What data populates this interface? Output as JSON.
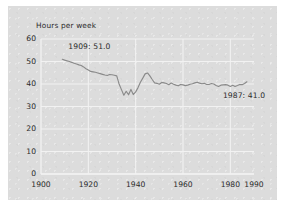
{
  "chart_data": {
    "type": "line",
    "title": "",
    "subtitle": "",
    "xlabel": "",
    "ylabel": "Hours per week",
    "xlim": [
      1900,
      1990
    ],
    "ylim": [
      0,
      60
    ],
    "grid": true,
    "legend": "none",
    "x_ticks": [
      "1900",
      "1920",
      "1940",
      "1960",
      "1980",
      "1990"
    ],
    "x_tick_values": [
      1900,
      1920,
      1940,
      1960,
      1980,
      1990
    ],
    "y_ticks": [
      "0",
      "10",
      "20",
      "30",
      "40",
      "50",
      "60"
    ],
    "y_tick_values": [
      0,
      10,
      20,
      30,
      40,
      50,
      60
    ],
    "line_color": "#8a8a8a",
    "grid_color": "#f2f2f2",
    "panel_color": "#dcdcdc",
    "text_color": "#2b2b2b",
    "annotations": [
      {
        "id": "start",
        "label": "1909: 51.0",
        "x": 1909,
        "y": 51.0
      },
      {
        "id": "end",
        "label": "1987: 41.0",
        "x": 1987,
        "y": 41.0
      }
    ],
    "series": [
      {
        "name": "Average hours worked per week",
        "x": [
          1909,
          1910,
          1911,
          1912,
          1913,
          1914,
          1915,
          1916,
          1917,
          1918,
          1919,
          1920,
          1921,
          1922,
          1923,
          1924,
          1925,
          1926,
          1927,
          1928,
          1929,
          1930,
          1931,
          1932,
          1933,
          1934,
          1935,
          1936,
          1937,
          1938,
          1939,
          1940,
          1941,
          1942,
          1943,
          1944,
          1945,
          1946,
          1947,
          1948,
          1949,
          1950,
          1951,
          1952,
          1953,
          1954,
          1955,
          1956,
          1957,
          1958,
          1959,
          1960,
          1961,
          1962,
          1963,
          1964,
          1965,
          1966,
          1967,
          1968,
          1969,
          1970,
          1971,
          1972,
          1973,
          1974,
          1975,
          1976,
          1977,
          1978,
          1979,
          1980,
          1981,
          1982,
          1983,
          1984,
          1985,
          1986,
          1987
        ],
        "values": [
          51.0,
          50.6,
          50.3,
          50.0,
          49.6,
          49.2,
          48.9,
          48.5,
          48.2,
          47.6,
          46.8,
          46.2,
          45.6,
          45.4,
          45.2,
          44.9,
          44.6,
          44.3,
          44.0,
          43.8,
          44.2,
          44.1,
          43.9,
          43.6,
          40.0,
          37.5,
          35.0,
          36.8,
          35.2,
          37.6,
          35.3,
          36.5,
          38.4,
          40.8,
          42.6,
          44.5,
          44.9,
          43.6,
          42.0,
          40.5,
          40.3,
          39.9,
          40.7,
          40.5,
          40.2,
          39.7,
          40.4,
          39.9,
          39.5,
          39.2,
          39.8,
          39.6,
          39.3,
          39.5,
          39.9,
          40.1,
          40.5,
          40.8,
          40.4,
          40.1,
          40.3,
          39.8,
          39.8,
          40.2,
          40.0,
          39.3,
          38.9,
          39.5,
          39.6,
          39.7,
          39.5,
          38.9,
          39.4,
          38.9,
          39.3,
          39.8,
          39.7,
          40.2,
          41.0
        ]
      }
    ]
  },
  "axis": {
    "ylabel_text": "Hours per week"
  }
}
